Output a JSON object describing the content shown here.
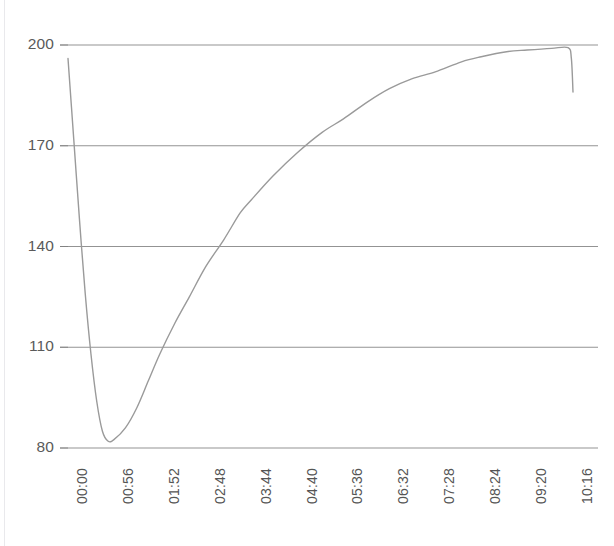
{
  "chart_data": {
    "type": "line",
    "title": "",
    "xlabel": "",
    "ylabel": "",
    "grid": true,
    "legend": false,
    "legend_position": "none",
    "line_color": "#9a9a9a",
    "gridline_color": "#808080",
    "background_color": "#ffffff",
    "ylim": [
      80,
      200
    ],
    "yticks": [
      80,
      110,
      140,
      170,
      200
    ],
    "ytick_labels": [
      "80",
      "110",
      "140",
      "170",
      "200"
    ],
    "xtick_labels": [
      "00:00",
      "00:56",
      "01:52",
      "02:48",
      "03:44",
      "04:40",
      "05:36",
      "06:32",
      "07:28",
      "08:24",
      "09:20",
      "10:16"
    ],
    "x_interval_seconds": 56,
    "x": [
      "00:00",
      "00:07",
      "00:14",
      "00:21",
      "00:28",
      "00:35",
      "00:42",
      "00:49",
      "00:56",
      "01:10",
      "01:24",
      "01:38",
      "01:52",
      "02:10",
      "02:28",
      "02:48",
      "03:10",
      "03:30",
      "03:44",
      "04:10",
      "04:40",
      "05:10",
      "05:36",
      "06:05",
      "06:32",
      "07:00",
      "07:28",
      "08:00",
      "08:24",
      "08:55",
      "09:20",
      "09:50",
      "10:10",
      "10:14",
      "10:16"
    ],
    "values": [
      196,
      172,
      148,
      126,
      108,
      94,
      85,
      82,
      82.5,
      86,
      92,
      100,
      108,
      117,
      125,
      134,
      142,
      150,
      154,
      161,
      168,
      174,
      178,
      183,
      187,
      190,
      192,
      195,
      196.5,
      198,
      198.5,
      199,
      199.2,
      196,
      186
    ],
    "series_name": "value",
    "annotations": []
  },
  "axis": {
    "y_axis_name": "y-axis",
    "x_axis_name": "x-axis-time"
  }
}
